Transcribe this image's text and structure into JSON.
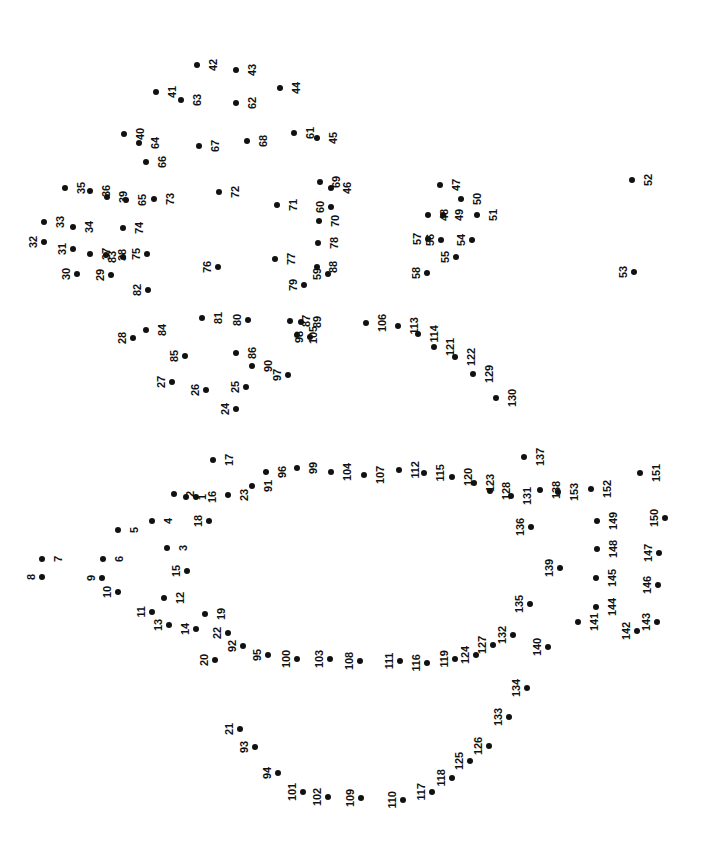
{
  "page": {
    "kind": "dot-to-dot-puzzle",
    "width": 703,
    "height": 866,
    "background_color": "#ffffff",
    "dot_color": "#111111",
    "label_color": "#111111",
    "label_rotation_degrees": -90,
    "total_dots": 153
  },
  "dots": [
    {
      "n": "1",
      "x": 186,
      "y": 497,
      "side": "left"
    },
    {
      "n": "2",
      "x": 174,
      "y": 494,
      "side": "left"
    },
    {
      "n": "3",
      "x": 167,
      "y": 548,
      "side": "left"
    },
    {
      "n": "4",
      "x": 152,
      "y": 521,
      "side": "left"
    },
    {
      "n": "5",
      "x": 118,
      "y": 530,
      "side": "left"
    },
    {
      "n": "6",
      "x": 103,
      "y": 559,
      "side": "left"
    },
    {
      "n": "7",
      "x": 42,
      "y": 559,
      "side": "left"
    },
    {
      "n": "8",
      "x": 42,
      "y": 577,
      "side": "right"
    },
    {
      "n": "9",
      "x": 102,
      "y": 578,
      "side": "right"
    },
    {
      "n": "10",
      "x": 118,
      "y": 592,
      "side": "right"
    },
    {
      "n": "11",
      "x": 152,
      "y": 612,
      "side": "right"
    },
    {
      "n": "12",
      "x": 164,
      "y": 598,
      "side": "left"
    },
    {
      "n": "13",
      "x": 169,
      "y": 625,
      "side": "right"
    },
    {
      "n": "14",
      "x": 196,
      "y": 629,
      "side": "right"
    },
    {
      "n": "15",
      "x": 187,
      "y": 571,
      "side": "right"
    },
    {
      "n": "16",
      "x": 196,
      "y": 497,
      "side": "left"
    },
    {
      "n": "17",
      "x": 213,
      "y": 460,
      "side": "left"
    },
    {
      "n": "18",
      "x": 209,
      "y": 521,
      "side": "right"
    },
    {
      "n": "19",
      "x": 205,
      "y": 614,
      "side": "left"
    },
    {
      "n": "20",
      "x": 215,
      "y": 660,
      "side": "right"
    },
    {
      "n": "21",
      "x": 240,
      "y": 729,
      "side": "right"
    },
    {
      "n": "22",
      "x": 228,
      "y": 633,
      "side": "right"
    },
    {
      "n": "23",
      "x": 228,
      "y": 495,
      "side": "left"
    },
    {
      "n": "24",
      "x": 236,
      "y": 409,
      "side": "right"
    },
    {
      "n": "25",
      "x": 246,
      "y": 387,
      "side": "right"
    },
    {
      "n": "26",
      "x": 206,
      "y": 390,
      "side": "right"
    },
    {
      "n": "27",
      "x": 172,
      "y": 382,
      "side": "right"
    },
    {
      "n": "28",
      "x": 133,
      "y": 338,
      "side": "right"
    },
    {
      "n": "29",
      "x": 111,
      "y": 275,
      "side": "right"
    },
    {
      "n": "30",
      "x": 77,
      "y": 274,
      "side": "right"
    },
    {
      "n": "31",
      "x": 73,
      "y": 249,
      "side": "right"
    },
    {
      "n": "32",
      "x": 44,
      "y": 242,
      "side": "right"
    },
    {
      "n": "33",
      "x": 44,
      "y": 222,
      "side": "left"
    },
    {
      "n": "34",
      "x": 73,
      "y": 227,
      "side": "left"
    },
    {
      "n": "35",
      "x": 65,
      "y": 188,
      "side": "left"
    },
    {
      "n": "36",
      "x": 90,
      "y": 191,
      "side": "left"
    },
    {
      "n": "37",
      "x": 90,
      "y": 254,
      "side": "left"
    },
    {
      "n": "38",
      "x": 106,
      "y": 255,
      "side": "left"
    },
    {
      "n": "39",
      "x": 107,
      "y": 197,
      "side": "left"
    },
    {
      "n": "40",
      "x": 124,
      "y": 134,
      "side": "left"
    },
    {
      "n": "41",
      "x": 156,
      "y": 92,
      "side": "left"
    },
    {
      "n": "42",
      "x": 197,
      "y": 65,
      "side": "left"
    },
    {
      "n": "43",
      "x": 236,
      "y": 70,
      "side": "left"
    },
    {
      "n": "44",
      "x": 280,
      "y": 88,
      "side": "left"
    },
    {
      "n": "45",
      "x": 317,
      "y": 138,
      "side": "left"
    },
    {
      "n": "46",
      "x": 331,
      "y": 188,
      "side": "left"
    },
    {
      "n": "47",
      "x": 440,
      "y": 185,
      "side": "left"
    },
    {
      "n": "48",
      "x": 428,
      "y": 215,
      "side": "left"
    },
    {
      "n": "49",
      "x": 443,
      "y": 215,
      "side": "left"
    },
    {
      "n": "50",
      "x": 461,
      "y": 199,
      "side": "left"
    },
    {
      "n": "51",
      "x": 477,
      "y": 215,
      "side": "left"
    },
    {
      "n": "52",
      "x": 632,
      "y": 180,
      "side": "left"
    },
    {
      "n": "53",
      "x": 634,
      "y": 272,
      "side": "right"
    },
    {
      "n": "54",
      "x": 472,
      "y": 240,
      "side": "right"
    },
    {
      "n": "55",
      "x": 456,
      "y": 257,
      "side": "right"
    },
    {
      "n": "56",
      "x": 441,
      "y": 240,
      "side": "right"
    },
    {
      "n": "57",
      "x": 428,
      "y": 239,
      "side": "right"
    },
    {
      "n": "58",
      "x": 427,
      "y": 273,
      "side": "right"
    },
    {
      "n": "59",
      "x": 328,
      "y": 274,
      "side": "right"
    },
    {
      "n": "60",
      "x": 331,
      "y": 207,
      "side": "right"
    },
    {
      "n": "61",
      "x": 294,
      "y": 133,
      "side": "left"
    },
    {
      "n": "62",
      "x": 236,
      "y": 103,
      "side": "left"
    },
    {
      "n": "63",
      "x": 181,
      "y": 100,
      "side": "left"
    },
    {
      "n": "64",
      "x": 139,
      "y": 143,
      "side": "left"
    },
    {
      "n": "65",
      "x": 126,
      "y": 200,
      "side": "left"
    },
    {
      "n": "66",
      "x": 146,
      "y": 162,
      "side": "left"
    },
    {
      "n": "67",
      "x": 199,
      "y": 146,
      "side": "left"
    },
    {
      "n": "68",
      "x": 247,
      "y": 141,
      "side": "left"
    },
    {
      "n": "69",
      "x": 320,
      "y": 182,
      "side": "left"
    },
    {
      "n": "70",
      "x": 319,
      "y": 221,
      "side": "left"
    },
    {
      "n": "71",
      "x": 277,
      "y": 205,
      "side": "left"
    },
    {
      "n": "72",
      "x": 219,
      "y": 192,
      "side": "left"
    },
    {
      "n": "73",
      "x": 154,
      "y": 199,
      "side": "left"
    },
    {
      "n": "74",
      "x": 123,
      "y": 228,
      "side": "left"
    },
    {
      "n": "75",
      "x": 147,
      "y": 254,
      "side": "right"
    },
    {
      "n": "76",
      "x": 218,
      "y": 267,
      "side": "right"
    },
    {
      "n": "77",
      "x": 275,
      "y": 259,
      "side": "left"
    },
    {
      "n": "78",
      "x": 318,
      "y": 243,
      "side": "left"
    },
    {
      "n": "79",
      "x": 304,
      "y": 285,
      "side": "right"
    },
    {
      "n": "80",
      "x": 248,
      "y": 320,
      "side": "right"
    },
    {
      "n": "81",
      "x": 202,
      "y": 318,
      "side": "left"
    },
    {
      "n": "82",
      "x": 148,
      "y": 290,
      "side": "right"
    },
    {
      "n": "83",
      "x": 123,
      "y": 257,
      "side": "right"
    },
    {
      "n": "84",
      "x": 146,
      "y": 330,
      "side": "left"
    },
    {
      "n": "85",
      "x": 185,
      "y": 356,
      "side": "right"
    },
    {
      "n": "86",
      "x": 236,
      "y": 353,
      "side": "left"
    },
    {
      "n": "87",
      "x": 290,
      "y": 321,
      "side": "left"
    },
    {
      "n": "88",
      "x": 317,
      "y": 267,
      "side": "left"
    },
    {
      "n": "89",
      "x": 301,
      "y": 322,
      "side": "left"
    },
    {
      "n": "90",
      "x": 252,
      "y": 366,
      "side": "left"
    },
    {
      "n": "91",
      "x": 252,
      "y": 486,
      "side": "left"
    },
    {
      "n": "92",
      "x": 243,
      "y": 646,
      "side": "right"
    },
    {
      "n": "93",
      "x": 255,
      "y": 747,
      "side": "right"
    },
    {
      "n": "94",
      "x": 278,
      "y": 773,
      "side": "right"
    },
    {
      "n": "95",
      "x": 268,
      "y": 655,
      "side": "right"
    },
    {
      "n": "96",
      "x": 266,
      "y": 472,
      "side": "left"
    },
    {
      "n": "97",
      "x": 288,
      "y": 375,
      "side": "right"
    },
    {
      "n": "98",
      "x": 310,
      "y": 337,
      "side": "right"
    },
    {
      "n": "99",
      "x": 297,
      "y": 468,
      "side": "left"
    },
    {
      "n": "100",
      "x": 297,
      "y": 659,
      "side": "right"
    },
    {
      "n": "101",
      "x": 303,
      "y": 792,
      "side": "right"
    },
    {
      "n": "102",
      "x": 328,
      "y": 797,
      "side": "right"
    },
    {
      "n": "103",
      "x": 330,
      "y": 659,
      "side": "right"
    },
    {
      "n": "104",
      "x": 331,
      "y": 472,
      "side": "left"
    },
    {
      "n": "105",
      "x": 297,
      "y": 335,
      "side": "left"
    },
    {
      "n": "106",
      "x": 366,
      "y": 323,
      "side": "left"
    },
    {
      "n": "107",
      "x": 364,
      "y": 475,
      "side": "left"
    },
    {
      "n": "108",
      "x": 360,
      "y": 661,
      "side": "right"
    },
    {
      "n": "109",
      "x": 361,
      "y": 798,
      "side": "right"
    },
    {
      "n": "110",
      "x": 403,
      "y": 800,
      "side": "right"
    },
    {
      "n": "111",
      "x": 400,
      "y": 661,
      "side": "right"
    },
    {
      "n": "112",
      "x": 399,
      "y": 470,
      "side": "left"
    },
    {
      "n": "113",
      "x": 398,
      "y": 326,
      "side": "left"
    },
    {
      "n": "114",
      "x": 418,
      "y": 334,
      "side": "left"
    },
    {
      "n": "115",
      "x": 424,
      "y": 473,
      "side": "left"
    },
    {
      "n": "116",
      "x": 427,
      "y": 663,
      "side": "right"
    },
    {
      "n": "117",
      "x": 432,
      "y": 792,
      "side": "right"
    },
    {
      "n": "118",
      "x": 452,
      "y": 778,
      "side": "right"
    },
    {
      "n": "119",
      "x": 455,
      "y": 659,
      "side": "right"
    },
    {
      "n": "120",
      "x": 452,
      "y": 477,
      "side": "left"
    },
    {
      "n": "121",
      "x": 434,
      "y": 347,
      "side": "left"
    },
    {
      "n": "122",
      "x": 455,
      "y": 357,
      "side": "left"
    },
    {
      "n": "123",
      "x": 474,
      "y": 483,
      "side": "left"
    },
    {
      "n": "124",
      "x": 476,
      "y": 655,
      "side": "right"
    },
    {
      "n": "125",
      "x": 470,
      "y": 761,
      "side": "right"
    },
    {
      "n": "126",
      "x": 489,
      "y": 746,
      "side": "right"
    },
    {
      "n": "127",
      "x": 493,
      "y": 645,
      "side": "right"
    },
    {
      "n": "128",
      "x": 490,
      "y": 491,
      "side": "left"
    },
    {
      "n": "129",
      "x": 473,
      "y": 374,
      "side": "left"
    },
    {
      "n": "130",
      "x": 496,
      "y": 398,
      "side": "left"
    },
    {
      "n": "131",
      "x": 511,
      "y": 496,
      "side": "left"
    },
    {
      "n": "132",
      "x": 513,
      "y": 635,
      "side": "right"
    },
    {
      "n": "133",
      "x": 509,
      "y": 717,
      "side": "right"
    },
    {
      "n": "134",
      "x": 527,
      "y": 688,
      "side": "right"
    },
    {
      "n": "135",
      "x": 530,
      "y": 604,
      "side": "right"
    },
    {
      "n": "136",
      "x": 531,
      "y": 527,
      "side": "right"
    },
    {
      "n": "137",
      "x": 524,
      "y": 457,
      "side": "left"
    },
    {
      "n": "138",
      "x": 540,
      "y": 490,
      "side": "left"
    },
    {
      "n": "139",
      "x": 560,
      "y": 568,
      "side": "right"
    },
    {
      "n": "140",
      "x": 548,
      "y": 647,
      "side": "right"
    },
    {
      "n": "141",
      "x": 578,
      "y": 622,
      "side": "left"
    },
    {
      "n": "142",
      "x": 637,
      "y": 631,
      "side": "right"
    },
    {
      "n": "143",
      "x": 657,
      "y": 622,
      "side": "right"
    },
    {
      "n": "144",
      "x": 596,
      "y": 607,
      "side": "left"
    },
    {
      "n": "145",
      "x": 596,
      "y": 578,
      "side": "left"
    },
    {
      "n": "146",
      "x": 658,
      "y": 585,
      "side": "right"
    },
    {
      "n": "147",
      "x": 659,
      "y": 553,
      "side": "right"
    },
    {
      "n": "148",
      "x": 597,
      "y": 549,
      "side": "left"
    },
    {
      "n": "149",
      "x": 597,
      "y": 521,
      "side": "left"
    },
    {
      "n": "150",
      "x": 665,
      "y": 518,
      "side": "right"
    },
    {
      "n": "151",
      "x": 640,
      "y": 473,
      "side": "left"
    },
    {
      "n": "152",
      "x": 591,
      "y": 489,
      "side": "left"
    },
    {
      "n": "153",
      "x": 558,
      "y": 492,
      "side": "left"
    }
  ]
}
